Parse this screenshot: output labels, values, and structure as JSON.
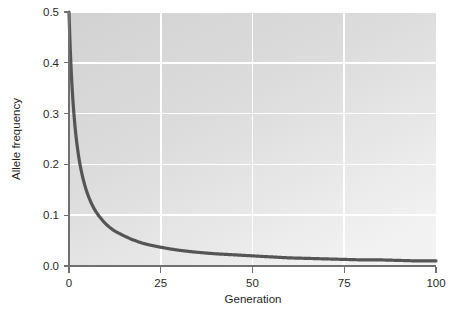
{
  "chart_data": {
    "type": "line",
    "title": "",
    "xlabel": "Generation",
    "ylabel": "Allele frequency",
    "xlim": [
      0,
      100
    ],
    "ylim": [
      0.0,
      0.5
    ],
    "xticks": [
      0,
      25,
      50,
      75,
      100
    ],
    "xtick_labels": [
      "0",
      "25",
      "50",
      "75",
      "100"
    ],
    "yticks": [
      0.0,
      0.1,
      0.2,
      0.3,
      0.4,
      0.5
    ],
    "ytick_labels": [
      "0.0",
      "0.1",
      "0.2",
      "0.3",
      "0.4",
      "0.5"
    ],
    "grid": "on",
    "grid_color": "#ffffff",
    "plot_background": "#d8d8d8",
    "figure_background": "#ffffff",
    "legend": "none",
    "series": [
      {
        "name": "Allele frequency",
        "color": "#555555",
        "line_width": 3,
        "x": [
          0,
          1,
          2,
          3,
          4,
          5,
          6,
          7,
          8,
          9,
          10,
          12,
          14,
          16,
          18,
          20,
          25,
          30,
          35,
          40,
          45,
          50,
          55,
          60,
          65,
          70,
          75,
          80,
          85,
          90,
          95,
          100
        ],
        "y": [
          0.5,
          0.333,
          0.25,
          0.2,
          0.167,
          0.143,
          0.125,
          0.111,
          0.1,
          0.091,
          0.083,
          0.071,
          0.063,
          0.056,
          0.05,
          0.045,
          0.037,
          0.031,
          0.027,
          0.024,
          0.022,
          0.02,
          0.018,
          0.016,
          0.015,
          0.014,
          0.013,
          0.012,
          0.012,
          0.011,
          0.01,
          0.01
        ]
      }
    ]
  },
  "axes": {
    "y_title": "Allele frequency",
    "x_title": "Generation"
  },
  "colors": {
    "curve": "#555555",
    "axis": "#6b6b6b",
    "grid": "#ffffff",
    "panel": "#d8d8d8",
    "text": "#1f1f1f"
  }
}
